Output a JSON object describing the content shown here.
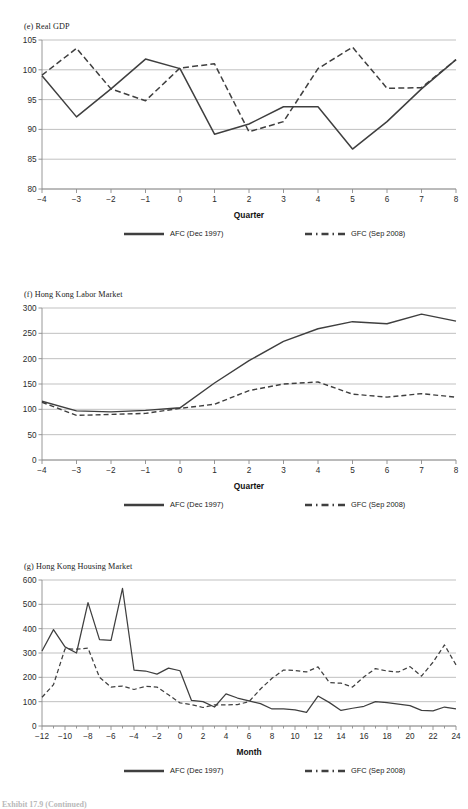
{
  "page": {
    "footer_note": "Exhibit 17.9  (Continued)"
  },
  "legend": {
    "afc_label": "AFC (Dec 1997)",
    "gfc_label": "GFC (Sep 2008)",
    "afc_style": "solid",
    "gfc_style": "dashed",
    "line_color": "#3f3f3f"
  },
  "chart_data": [
    {
      "id": "panel-e",
      "type": "line",
      "title": "(e) Real GDP",
      "xlabel": "Quarter",
      "ylabel": "",
      "x": [
        -4,
        -3,
        -2,
        -1,
        0,
        1,
        2,
        3,
        4,
        5,
        6,
        7,
        8
      ],
      "xticks": [
        "−4",
        "−3",
        "−2",
        "−1",
        "0",
        "1",
        "2",
        "3",
        "4",
        "5",
        "6",
        "7",
        "8"
      ],
      "yticks": [
        80,
        85,
        90,
        95,
        100,
        105
      ],
      "ylim": [
        80,
        105
      ],
      "xlim": [
        -4,
        8
      ],
      "grid": "horizontal",
      "legend_position": "bottom",
      "series": [
        {
          "name": "AFC (Dec 1997)",
          "style": "solid",
          "values": [
            99.0,
            92.1,
            96.8,
            101.8,
            100.2,
            89.2,
            90.9,
            93.8,
            93.8,
            86.7,
            91.3,
            96.8,
            101.7
          ]
        },
        {
          "name": "GFC (Sep 2008)",
          "style": "dashed",
          "values": [
            99.1,
            103.6,
            96.8,
            94.8,
            100.3,
            101.0,
            89.6,
            91.3,
            100.2,
            103.8,
            96.9,
            97.0,
            101.7
          ]
        }
      ]
    },
    {
      "id": "panel-f",
      "type": "line",
      "title": "(f) Hong Kong Labor Market",
      "xlabel": "Quarter",
      "ylabel": "",
      "x": [
        -4,
        -3,
        -2,
        -1,
        0,
        1,
        2,
        3,
        4,
        5,
        6,
        7,
        8
      ],
      "xticks": [
        "−4",
        "−3",
        "−2",
        "−1",
        "0",
        "1",
        "2",
        "3",
        "4",
        "5",
        "6",
        "7",
        "8"
      ],
      "yticks": [
        0,
        50,
        100,
        150,
        200,
        250,
        300
      ],
      "ylim": [
        0,
        300
      ],
      "xlim": [
        -4,
        8
      ],
      "grid": "horizontal",
      "legend_position": "bottom",
      "series": [
        {
          "name": "AFC (Dec 1997)",
          "style": "solid",
          "values": [
            116,
            97,
            95,
            98,
            103,
            152,
            196,
            234,
            259,
            273,
            269,
            288,
            274
          ]
        },
        {
          "name": "GFC (Sep 2008)",
          "style": "dashed",
          "values": [
            114,
            88,
            90,
            92,
            102,
            110,
            137,
            150,
            154,
            130,
            124,
            131,
            124
          ]
        }
      ]
    },
    {
      "id": "panel-g",
      "type": "line",
      "title": "(g) Hong Kong Housing Market",
      "xlabel": "Month",
      "ylabel": "",
      "x": [
        -12,
        -11,
        -10,
        -9,
        -8,
        -7,
        -6,
        -5,
        -4,
        -3,
        -2,
        -1,
        0,
        1,
        2,
        3,
        4,
        5,
        6,
        7,
        8,
        9,
        10,
        11,
        12,
        13,
        14,
        15,
        16,
        17,
        18,
        19,
        20,
        21,
        22,
        23,
        24
      ],
      "xticks": [
        "−12",
        "−10",
        "−8",
        "−6",
        "−4",
        "−2",
        "0",
        "2",
        "4",
        "6",
        "8",
        "10",
        "12",
        "14",
        "16",
        "18",
        "20",
        "22",
        "24"
      ],
      "yticks": [
        0,
        100,
        200,
        300,
        400,
        500,
        600
      ],
      "ylim": [
        0,
        600
      ],
      "xlim": [
        -12,
        24
      ],
      "grid": "horizontal",
      "legend_position": "bottom",
      "series": [
        {
          "name": "AFC (Dec 1997)",
          "style": "solid",
          "values": [
            308,
            396,
            325,
            300,
            507,
            355,
            352,
            566,
            230,
            226,
            213,
            238,
            227,
            105,
            100,
            78,
            132,
            115,
            103,
            92,
            70,
            70,
            66,
            56,
            123,
            96,
            64,
            73,
            81,
            100,
            96,
            90,
            84,
            64,
            62,
            78,
            70
          ]
        },
        {
          "name": "GFC (Sep 2008)",
          "style": "dashed",
          "values": [
            118,
            170,
            317,
            316,
            320,
            200,
            160,
            164,
            150,
            163,
            160,
            128,
            95,
            88,
            76,
            87,
            87,
            88,
            100,
            152,
            196,
            230,
            228,
            222,
            243,
            178,
            176,
            160,
            202,
            236,
            226,
            222,
            244,
            205,
            262,
            333,
            251
          ]
        }
      ]
    }
  ]
}
